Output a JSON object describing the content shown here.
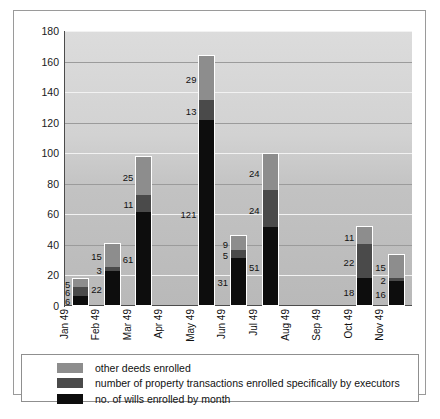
{
  "chart_data": {
    "type": "bar",
    "subtype": "stacked-bar-vertical",
    "title": "",
    "xlabel": "",
    "ylabel": "",
    "ylim": [
      0,
      180
    ],
    "ytick_step": 20,
    "yticks": [
      "180",
      "160",
      "140",
      "120",
      "100",
      "80",
      "60",
      "40",
      "20",
      "0"
    ],
    "grid": true,
    "legend_position": "bottom",
    "categories": [
      "Jan 49",
      "Feb 49",
      "Mar 49",
      "Apr 49",
      "May 49",
      "Jun 49",
      "Jul 49",
      "Aug 49",
      "Sep 49",
      "Oct 49",
      "Nov 49"
    ],
    "series": [
      {
        "name": "no. of wills enrolled by month",
        "color": "#0d0d0d",
        "values": [
          6,
          22,
          61,
          0,
          121,
          31,
          51,
          0,
          0,
          18,
          16
        ]
      },
      {
        "name": "number of property transactions enrolled specifically by executors",
        "color": "#4a4a4a",
        "values": [
          6,
          3,
          11,
          0,
          13,
          5,
          24,
          0,
          0,
          22,
          2
        ]
      },
      {
        "name": "other deeds enrolled",
        "color": "#8d8d8d",
        "values": [
          5,
          15,
          25,
          0,
          29,
          9,
          24,
          0,
          0,
          11,
          15
        ]
      }
    ],
    "totals": [
      17,
      40,
      97,
      0,
      163,
      45,
      99,
      0,
      0,
      51,
      33
    ],
    "data_labels": {
      "Jan 49": {
        "wills": "6",
        "property": "6",
        "other": "5"
      },
      "Feb 49": {
        "wills": "22",
        "property": "3",
        "other": "15"
      },
      "Mar 49": {
        "wills": "61",
        "property": "11",
        "other": "25"
      },
      "Apr 49": {
        "wills": "",
        "property": "",
        "other": ""
      },
      "May 49": {
        "wills": "121",
        "property": "13",
        "other": "29"
      },
      "Jun 49": {
        "wills": "31",
        "property": "5",
        "other": "9"
      },
      "Jul 49": {
        "wills": "51",
        "property": "24",
        "other": "24"
      },
      "Aug 49": {
        "wills": "",
        "property": "",
        "other": ""
      },
      "Sep 49": {
        "wills": "",
        "property": "",
        "other": ""
      },
      "Oct 49": {
        "wills": "18",
        "property": "22",
        "other": "11"
      },
      "Nov 49": {
        "wills": "16",
        "property": "2",
        "other": "15"
      }
    }
  },
  "legend": {
    "items": [
      {
        "label": "other deeds enrolled",
        "color": "#8d8d8d"
      },
      {
        "label": "number of property transactions enrolled specifically by executors",
        "color": "#4a4a4a"
      },
      {
        "label": "no. of wills enrolled by month",
        "color": "#0d0d0d"
      }
    ]
  },
  "colors": {
    "plot_background_top": "#dcdcdc",
    "plot_background_bottom": "#b9b9b9",
    "gridline": "#f2f2f2",
    "axis": "#4c4c4c",
    "border": "#9a9a9a",
    "text": "#111111"
  }
}
